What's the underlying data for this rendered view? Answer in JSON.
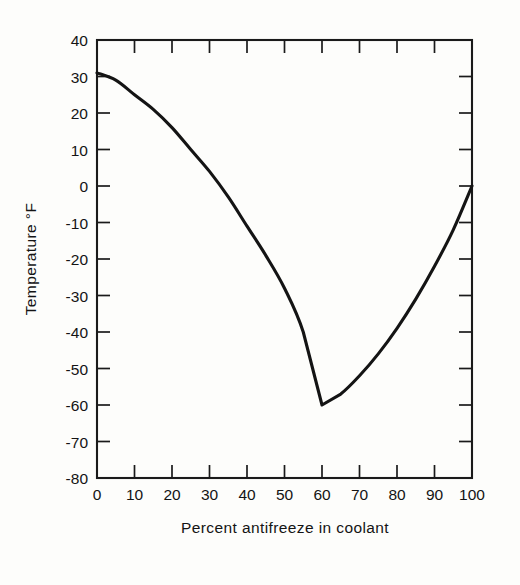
{
  "chart_data": {
    "type": "line",
    "title": "",
    "xlabel": "Percent antifreeze in coolant",
    "ylabel": "Temperature °F",
    "xlim": [
      0,
      100
    ],
    "ylim": [
      -80,
      40
    ],
    "grid": false,
    "legend": false,
    "x_ticks": [
      0,
      10,
      20,
      30,
      40,
      50,
      60,
      70,
      80,
      90,
      100
    ],
    "x_tick_labels": [
      "0",
      "10",
      "20",
      "30",
      "40",
      "50",
      "60",
      "70",
      "80",
      "90",
      "100"
    ],
    "y_ticks": [
      40,
      30,
      20,
      10,
      0,
      -10,
      -20,
      -30,
      -40,
      -50,
      -60,
      -70,
      -80
    ],
    "y_tick_labels": [
      "40",
      "30",
      "20",
      "10",
      "0",
      "-10",
      "-20",
      "-30",
      "-40",
      "-50",
      "-60",
      "-70",
      "-80"
    ],
    "series": [
      {
        "name": "Freezing point of coolant",
        "x": [
          0,
          5,
          10,
          15,
          20,
          25,
          30,
          35,
          40,
          45,
          50,
          55,
          60,
          65,
          70,
          75,
          80,
          85,
          90,
          95,
          100
        ],
        "values": [
          31,
          29,
          25,
          21,
          16,
          10,
          4,
          -3,
          -11,
          -19,
          -28,
          -40,
          -60,
          -57,
          -52,
          -46,
          -39,
          -31,
          -22,
          -12,
          0
        ]
      }
    ],
    "annotations": [
      {
        "label": "minimum freezing point",
        "x": 60,
        "y": -60
      }
    ]
  },
  "axis": {
    "x_label": "Percent antifreeze in coolant",
    "y_label_text": "Temperature",
    "y_label_unit": "°F",
    "y_label_full": "Temperature  °F"
  },
  "colors": {
    "curve": "#141414",
    "axis": "#1a1a1a",
    "background": "#fdfdfb",
    "text": "#141414"
  }
}
